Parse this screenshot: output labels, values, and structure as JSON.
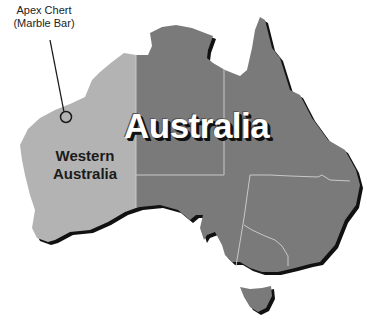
{
  "map": {
    "title": "Australia",
    "region_label": "Western Australia",
    "region_label_lines": [
      "Western",
      "Australia"
    ],
    "callout": {
      "line1": "Apex Chert",
      "line2": "(Marble Bar)"
    },
    "colors": {
      "western_australia": "#b3b3b3",
      "rest_of_australia": "#7a7a7a",
      "border_lines": "#c8c8c8",
      "shadow": "#111111",
      "background": "#ffffff",
      "title_text": "#ffffff"
    }
  }
}
